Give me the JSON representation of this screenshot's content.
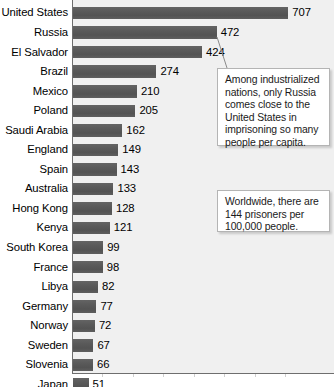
{
  "chart_data": {
    "type": "bar",
    "orientation": "horizontal",
    "title": "",
    "subtitle": "",
    "xlabel": "",
    "ylabel": "",
    "grid": false,
    "legend": null,
    "xlim": [
      0,
      760
    ],
    "categories": [
      "United States",
      "Russia",
      "El Salvador",
      "Brazil",
      "Mexico",
      "Poland",
      "Saudi Arabia",
      "England",
      "Spain",
      "Australia",
      "Hong Kong",
      "Kenya",
      "South Korea",
      "France",
      "Libya",
      "Germany",
      "Norway",
      "Sweden",
      "Slovenia",
      "Japan"
    ],
    "values": [
      707,
      472,
      424,
      274,
      210,
      205,
      162,
      149,
      143,
      133,
      128,
      121,
      99,
      98,
      82,
      77,
      72,
      67,
      66,
      51
    ],
    "value_labels": [
      "707",
      "472",
      "424",
      "274",
      "210",
      "205",
      "162",
      "149",
      "143",
      "133",
      "128",
      "121",
      "99",
      "98",
      "82",
      "77",
      "72",
      "67",
      "66",
      "51"
    ],
    "bar_color": "#595959",
    "plot_background": "#f0f0f0",
    "annotations": [
      {
        "id": "russia-note",
        "text": "Among industrialized nations, only Russia comes close to the United States in imprisoning so many people per capita.",
        "points_to": "Russia"
      },
      {
        "id": "worldwide-note",
        "text": "Worldwide, there are 144 prisoners per 100,000 people.",
        "points_to": null
      }
    ]
  }
}
